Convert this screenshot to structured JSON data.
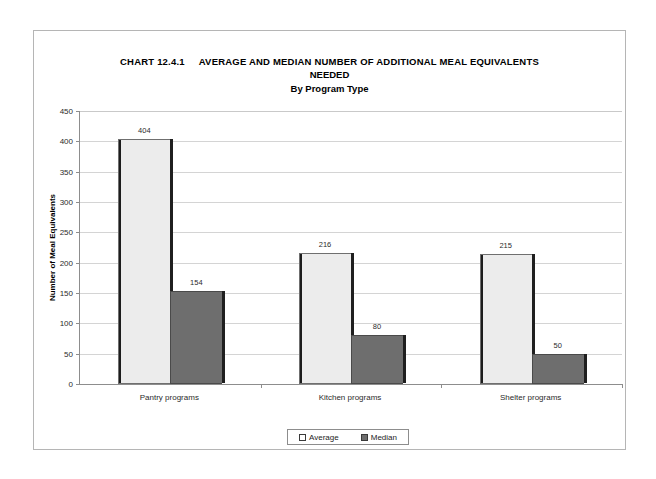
{
  "chart_data": {
    "type": "bar",
    "title_lines": {
      "chart_number": "CHART 12.4.1",
      "line1": "AVERAGE AND MEDIAN NUMBER OF ADDITIONAL MEAL EQUIVALENTS",
      "line2": "NEEDED",
      "subtitle": "By Program Type"
    },
    "categories": [
      "Pantry programs",
      "Kitchen programs",
      "Shelter programs"
    ],
    "series": [
      {
        "name": "Average",
        "values": [
          404,
          216,
          215
        ],
        "color": "#ececec"
      },
      {
        "name": "Median",
        "values": [
          154,
          80,
          50
        ],
        "color": "#6e6e6e"
      }
    ],
    "xlabel": "",
    "ylabel": "Number of Meal Equivalents",
    "ylim": [
      0,
      450
    ],
    "ytick_step": 50,
    "yticks": [
      450,
      400,
      350,
      300,
      250,
      200,
      150,
      100,
      50,
      0
    ],
    "ytick_labels": [
      "450",
      "400",
      "350",
      "300",
      "250",
      "200",
      "150",
      "100",
      "50",
      "0"
    ],
    "data_labels": {
      "pantry_average": "404",
      "pantry_median": "154",
      "kitchen_average": "216",
      "kitchen_median": "80",
      "shelter_average": "215",
      "shelter_median": "50"
    },
    "grid": true,
    "legend_position": "bottom",
    "legend_entries": [
      "Average",
      "Median"
    ]
  }
}
